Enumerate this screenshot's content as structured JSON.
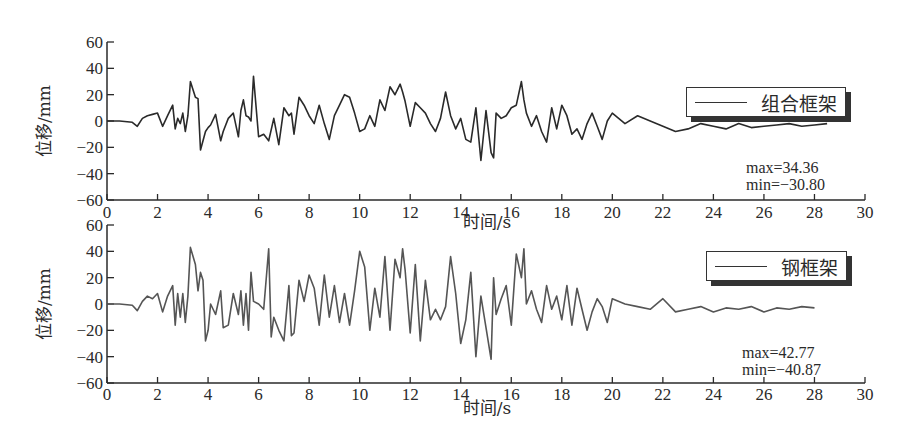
{
  "chart_data": [
    {
      "type": "line",
      "title": "",
      "xlabel": "时间/s",
      "ylabel": "位移/mm",
      "xlim": [
        0,
        30
      ],
      "ylim": [
        -60,
        60
      ],
      "xticks": [
        0,
        2,
        4,
        6,
        8,
        10,
        12,
        14,
        16,
        18,
        20,
        22,
        24,
        26,
        28,
        30
      ],
      "yticks": [
        60,
        40,
        20,
        0,
        -20,
        -40,
        -60
      ],
      "grid": false,
      "legend_position": "upper right",
      "series": [
        {
          "name": "组合框架",
          "color": "#2a2a2a",
          "x": [
            0,
            0.5,
            1.0,
            1.2,
            1.4,
            1.6,
            1.8,
            2.0,
            2.2,
            2.4,
            2.6,
            2.7,
            2.8,
            2.9,
            3.0,
            3.1,
            3.2,
            3.3,
            3.5,
            3.6,
            3.7,
            3.9,
            4.0,
            4.1,
            4.3,
            4.5,
            4.6,
            4.8,
            5.0,
            5.2,
            5.3,
            5.4,
            5.5,
            5.6,
            5.7,
            5.8,
            6.0,
            6.2,
            6.4,
            6.6,
            6.8,
            7.0,
            7.2,
            7.3,
            7.4,
            7.6,
            7.8,
            8.0,
            8.2,
            8.4,
            8.6,
            8.8,
            9.0,
            9.2,
            9.4,
            9.6,
            9.8,
            10.0,
            10.2,
            10.4,
            10.6,
            10.8,
            11.0,
            11.2,
            11.4,
            11.6,
            11.7,
            11.8,
            12.0,
            12.2,
            12.4,
            12.6,
            12.8,
            13.0,
            13.2,
            13.4,
            13.6,
            13.8,
            14.0,
            14.2,
            14.4,
            14.6,
            14.8,
            15.0,
            15.2,
            15.3,
            15.4,
            15.6,
            15.8,
            16.0,
            16.2,
            16.4,
            16.5,
            16.6,
            16.8,
            17.0,
            17.2,
            17.4,
            17.6,
            17.8,
            18.0,
            18.2,
            18.4,
            18.6,
            18.8,
            19.0,
            19.2,
            19.4,
            19.6,
            19.8,
            20.0,
            20.5,
            21.0,
            21.5,
            22.0,
            22.5,
            23.0,
            23.5,
            24.0,
            24.5,
            25.0,
            25.5,
            26.0,
            26.5,
            27.0,
            27.5,
            28.0,
            28.5,
            29.0,
            29.5,
            30.0
          ],
          "values": [
            0,
            0,
            -1,
            -4,
            2,
            4,
            5,
            6,
            -4,
            4,
            12,
            -6,
            2,
            -2,
            6,
            -8,
            4,
            30,
            18,
            17,
            -22,
            -8,
            -5,
            -3,
            5,
            -15,
            -8,
            2,
            6,
            -12,
            8,
            16,
            4,
            3,
            0,
            34,
            -12,
            -10,
            -15,
            2,
            -18,
            10,
            4,
            6,
            -10,
            18,
            12,
            4,
            -2,
            12,
            -2,
            -14,
            4,
            12,
            20,
            18,
            6,
            -8,
            -6,
            4,
            -4,
            16,
            8,
            26,
            20,
            28,
            22,
            15,
            -4,
            14,
            10,
            6,
            -2,
            -8,
            2,
            22,
            4,
            -6,
            2,
            -14,
            -16,
            10,
            -30,
            8,
            -24,
            -28,
            6,
            2,
            4,
            10,
            12,
            30,
            16,
            6,
            -4,
            4,
            -8,
            -16,
            10,
            -6,
            12,
            4,
            -10,
            -6,
            -14,
            -2,
            6,
            -4,
            -14,
            0,
            6,
            -2,
            4,
            0,
            -4,
            -8,
            -6,
            -2,
            -4,
            -6,
            -2,
            -5,
            -4,
            -3,
            -2,
            -4,
            -3,
            -2
          ]
        }
      ],
      "annotations": [
        "max=34.36",
        "min=−30.80"
      ]
    },
    {
      "type": "line",
      "title": "",
      "xlabel": "时间/s",
      "ylabel": "位移/mm",
      "xlim": [
        0,
        30
      ],
      "ylim": [
        -60,
        60
      ],
      "xticks": [
        0,
        2,
        4,
        6,
        8,
        10,
        12,
        14,
        16,
        18,
        20,
        22,
        24,
        26,
        28,
        30
      ],
      "yticks": [
        60,
        40,
        20,
        0,
        -20,
        -40,
        -60
      ],
      "grid": false,
      "legend_position": "upper right",
      "series": [
        {
          "name": "钢框架",
          "color": "#555555",
          "x": [
            0,
            0.5,
            1.0,
            1.2,
            1.4,
            1.6,
            1.8,
            2.0,
            2.2,
            2.4,
            2.6,
            2.7,
            2.8,
            2.9,
            3.0,
            3.1,
            3.2,
            3.3,
            3.5,
            3.6,
            3.7,
            3.8,
            3.9,
            4.0,
            4.1,
            4.3,
            4.5,
            4.6,
            4.8,
            5.0,
            5.2,
            5.3,
            5.4,
            5.5,
            5.6,
            5.7,
            5.8,
            6.0,
            6.2,
            6.4,
            6.5,
            6.6,
            6.8,
            7.0,
            7.2,
            7.3,
            7.4,
            7.6,
            7.8,
            8.0,
            8.2,
            8.4,
            8.6,
            8.8,
            9.0,
            9.2,
            9.4,
            9.6,
            9.8,
            10.0,
            10.2,
            10.4,
            10.6,
            10.8,
            11.0,
            11.2,
            11.4,
            11.6,
            11.7,
            11.8,
            12.0,
            12.2,
            12.4,
            12.6,
            12.8,
            13.0,
            13.2,
            13.4,
            13.6,
            13.8,
            14.0,
            14.2,
            14.4,
            14.6,
            14.8,
            15.0,
            15.2,
            15.3,
            15.4,
            15.6,
            15.8,
            16.0,
            16.2,
            16.4,
            16.5,
            16.6,
            16.8,
            17.0,
            17.2,
            17.4,
            17.6,
            17.8,
            18.0,
            18.2,
            18.4,
            18.6,
            18.8,
            19.0,
            19.2,
            19.4,
            19.6,
            19.8,
            20.0,
            20.5,
            21.0,
            21.5,
            22.0,
            22.5,
            23.0,
            23.5,
            24.0,
            24.5,
            25.0,
            25.5,
            26.0,
            26.5,
            27.0,
            27.5,
            28.0,
            28.5,
            29.0,
            29.5,
            30.0
          ],
          "values": [
            0,
            0,
            -1,
            -5,
            2,
            6,
            4,
            8,
            -6,
            6,
            14,
            -16,
            8,
            -10,
            8,
            -14,
            6,
            43,
            30,
            10,
            24,
            18,
            -28,
            -20,
            0,
            -8,
            10,
            -18,
            -16,
            8,
            -8,
            10,
            -16,
            8,
            -20,
            24,
            2,
            0,
            -4,
            42,
            -25,
            -10,
            -20,
            -28,
            14,
            -24,
            -22,
            18,
            2,
            22,
            12,
            -16,
            22,
            -10,
            14,
            -14,
            8,
            -16,
            10,
            40,
            28,
            -20,
            12,
            -10,
            36,
            -20,
            34,
            20,
            42,
            26,
            -22,
            30,
            -28,
            18,
            -12,
            -4,
            -12,
            -2,
            36,
            8,
            -30,
            -12,
            24,
            -40,
            6,
            -18,
            -42,
            20,
            -8,
            4,
            14,
            -16,
            38,
            20,
            42,
            0,
            10,
            -4,
            -14,
            14,
            -4,
            6,
            -12,
            14,
            -16,
            12,
            -4,
            -20,
            -6,
            4,
            -2,
            -14,
            4,
            0,
            -2,
            -4,
            4,
            -6,
            -4,
            -2,
            -6,
            -3,
            -4,
            -2,
            -6,
            -3,
            -4,
            -2,
            -3
          ]
        }
      ],
      "annotations": [
        "max=42.77",
        "min=−40.87"
      ]
    }
  ],
  "plots": [
    {
      "y_axis_label": "位移/mm",
      "x_axis_label": "时间/s",
      "legend_label": "组合框架",
      "max_label": "max=34.36",
      "min_label": "min=−30.80"
    },
    {
      "y_axis_label": "位移/mm",
      "x_axis_label": "时间/s",
      "legend_label": "钢框架",
      "max_label": "max=42.77",
      "min_label": "min=−40.87"
    }
  ]
}
